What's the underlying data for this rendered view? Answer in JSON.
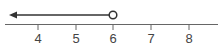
{
  "diagram": {
    "type": "number-line",
    "ticks": [
      {
        "value": 4,
        "label": "4",
        "x": 38
      },
      {
        "value": 5,
        "label": "5",
        "x": 76
      },
      {
        "value": 6,
        "label": "6",
        "x": 113
      },
      {
        "value": 7,
        "label": "7",
        "x": 151
      },
      {
        "value": 8,
        "label": "8",
        "x": 189
      }
    ],
    "ray": {
      "direction": "left",
      "endpoint_value": 6,
      "endpoint_type": "open-circle",
      "inequality": "x < 6"
    },
    "colors": {
      "line": "#555555",
      "ray": "#333333",
      "circle_fill": "#ffffff",
      "label": "#444444"
    }
  }
}
